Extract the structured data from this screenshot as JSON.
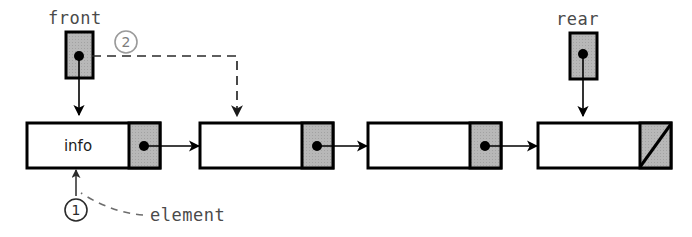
{
  "diagram": {
    "type": "linked-list-queue",
    "title_text": "",
    "labels": {
      "front": "front",
      "rear": "rear",
      "info": "info",
      "element": "element"
    },
    "markers": [
      {
        "id": "marker-1",
        "text": "1",
        "color": "#2b2b2b",
        "points_to": "element"
      },
      {
        "id": "marker-2",
        "text": "2",
        "color": "#9a9a9a",
        "points_to": "front-link"
      }
    ],
    "pointer_boxes": [
      {
        "name": "front",
        "label": "front",
        "fill": "#b5b5b5",
        "has_dot": true
      },
      {
        "name": "rear",
        "label": "rear",
        "fill": "#b5b5b5",
        "has_dot": true
      }
    ],
    "nodes": [
      {
        "index": 1,
        "info_text": "info",
        "link": "dot",
        "next": "node-2"
      },
      {
        "index": 2,
        "info_text": "",
        "link": "dot",
        "next": "node-3"
      },
      {
        "index": 3,
        "info_text": "",
        "link": "dot",
        "next": "node-4"
      },
      {
        "index": 4,
        "info_text": "",
        "link": "null-slash",
        "next": ""
      }
    ],
    "colors": {
      "stroke": "#000000",
      "link_field_fill": "#b5b5b5",
      "node_fill": "#ffffff",
      "dashed_line": "#333333",
      "text_gray": "#4a4a4a",
      "background": "#ffffff"
    }
  }
}
